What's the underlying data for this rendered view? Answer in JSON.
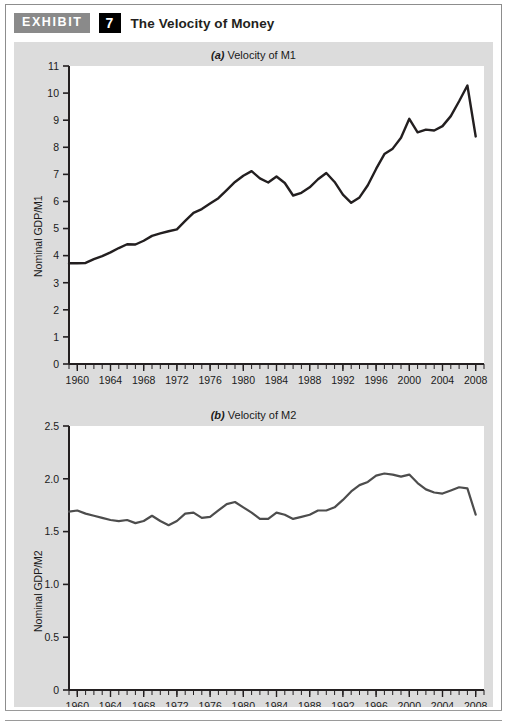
{
  "header": {
    "badge_label": "EXHIBIT",
    "exhibit_number": "7",
    "title": "The Velocity of Money"
  },
  "colors": {
    "panel_background": "#dcdcdc",
    "plot_background": "#ffffff",
    "line_m1": "#231f20",
    "line_m2": "#4d4d4d",
    "axis": "#231f20",
    "badge_gray": "#8a8a8a",
    "badge_black": "#000000"
  },
  "chart_data": [
    {
      "type": "line",
      "title": "(a) Velocity of M1",
      "title_label": "(a)",
      "title_text": "Velocity of M1",
      "xlabel": "",
      "ylabel": "Nominal GDP/M1",
      "xlim": [
        1959,
        2009
      ],
      "ylim": [
        0,
        11
      ],
      "yticks": [
        0,
        1,
        2,
        3,
        4,
        5,
        6,
        7,
        8,
        9,
        10,
        11
      ],
      "ytick_labels": [
        "0",
        "1",
        "2",
        "3",
        "4",
        "5",
        "6",
        "7",
        "8",
        "9",
        "10",
        "11"
      ],
      "xticks": [
        1960,
        1964,
        1968,
        1972,
        1976,
        1980,
        1984,
        1988,
        1992,
        1996,
        2000,
        2004,
        2008
      ],
      "xtick_labels": [
        "1960",
        "1964",
        "1968",
        "1972",
        "1976",
        "1980",
        "1984",
        "1988",
        "1992",
        "1996",
        "2000",
        "2004",
        "2008"
      ],
      "minor_xtick_interval": 1,
      "grid": false,
      "legend": "none",
      "series": [
        {
          "name": "Velocity of M1",
          "x": [
            1959,
            1960,
            1961,
            1962,
            1963,
            1964,
            1965,
            1966,
            1967,
            1968,
            1969,
            1970,
            1971,
            1972,
            1973,
            1974,
            1975,
            1976,
            1977,
            1978,
            1979,
            1980,
            1981,
            1982,
            1983,
            1984,
            1985,
            1986,
            1987,
            1988,
            1989,
            1990,
            1991,
            1992,
            1993,
            1994,
            1995,
            1996,
            1997,
            1998,
            1999,
            2000,
            2001,
            2002,
            2003,
            2004,
            2005,
            2006,
            2007,
            2008
          ],
          "values": [
            3.72,
            3.72,
            3.73,
            3.87,
            3.98,
            4.12,
            4.28,
            4.42,
            4.41,
            4.55,
            4.73,
            4.82,
            4.9,
            4.97,
            5.28,
            5.58,
            5.72,
            5.92,
            6.12,
            6.42,
            6.72,
            6.95,
            7.12,
            6.85,
            6.7,
            6.92,
            6.68,
            6.22,
            6.32,
            6.52,
            6.82,
            7.05,
            6.72,
            6.25,
            5.95,
            6.15,
            6.6,
            7.2,
            7.75,
            7.95,
            8.35,
            9.05,
            8.55,
            8.65,
            8.62,
            8.78,
            9.15,
            9.7,
            10.28,
            8.4
          ]
        }
      ]
    },
    {
      "type": "line",
      "title": "(b) Velocity of M2",
      "title_label": "(b)",
      "title_text": "Velocity of M2",
      "xlabel": "",
      "ylabel": "Nominal GDP/M2",
      "xlim": [
        1959,
        2009
      ],
      "ylim": [
        0,
        2.5
      ],
      "yticks": [
        0,
        0.5,
        1.0,
        1.5,
        2.0,
        2.5
      ],
      "ytick_labels": [
        "0",
        "0.5",
        "1.0",
        "1.5",
        "2.0",
        "2.5"
      ],
      "xticks": [
        1960,
        1964,
        1968,
        1972,
        1976,
        1980,
        1984,
        1988,
        1992,
        1996,
        2000,
        2004,
        2008
      ],
      "xtick_labels": [
        "1960",
        "1964",
        "1968",
        "1972",
        "1976",
        "1980",
        "1984",
        "1988",
        "1992",
        "1996",
        "2000",
        "2004",
        "2008"
      ],
      "minor_xtick_interval": 1,
      "grid": false,
      "legend": "none",
      "series": [
        {
          "name": "Velocity of M2",
          "x": [
            1959,
            1960,
            1961,
            1962,
            1963,
            1964,
            1965,
            1966,
            1967,
            1968,
            1969,
            1970,
            1971,
            1972,
            1973,
            1974,
            1975,
            1976,
            1977,
            1978,
            1979,
            1980,
            1981,
            1982,
            1983,
            1984,
            1985,
            1986,
            1987,
            1988,
            1989,
            1990,
            1991,
            1992,
            1993,
            1994,
            1995,
            1996,
            1997,
            1998,
            1999,
            2000,
            2001,
            2002,
            2003,
            2004,
            2005,
            2006,
            2007,
            2008
          ],
          "values": [
            1.69,
            1.7,
            1.67,
            1.65,
            1.63,
            1.61,
            1.6,
            1.61,
            1.58,
            1.6,
            1.65,
            1.6,
            1.56,
            1.6,
            1.67,
            1.68,
            1.63,
            1.64,
            1.7,
            1.76,
            1.78,
            1.73,
            1.68,
            1.62,
            1.62,
            1.68,
            1.66,
            1.62,
            1.64,
            1.66,
            1.7,
            1.7,
            1.73,
            1.8,
            1.88,
            1.94,
            1.97,
            2.03,
            2.05,
            2.04,
            2.02,
            2.04,
            1.96,
            1.9,
            1.87,
            1.86,
            1.89,
            1.92,
            1.91,
            1.66
          ]
        }
      ]
    }
  ]
}
